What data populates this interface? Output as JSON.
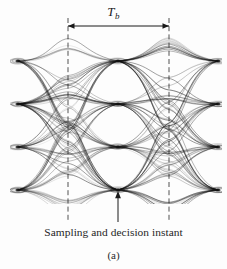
{
  "figure": {
    "kind": "eye-diagram",
    "width": 227,
    "height": 269,
    "background_color": "#fdfdfd",
    "trace_color": "#111111",
    "annotation_color": "#1a1a1a",
    "subfigure_label": "(a)",
    "symbol_period_label": "T",
    "symbol_period_subscript": "b",
    "sampling_caption": "Sampling and decision instant"
  },
  "chart_data": {
    "type": "line",
    "title": "",
    "subtitle": "",
    "xlabel": "",
    "ylabel": "",
    "legend": [],
    "grid": false,
    "annotations": [
      {
        "name": "symbol-period-arrow",
        "text": "T_b",
        "x_from": 68,
        "x_to": 169,
        "y": 26
      },
      {
        "name": "sampling-instant-arrow",
        "text": "Sampling and decision instant",
        "x": 118,
        "y_from": 222,
        "y_to": 191
      },
      {
        "name": "subfigure-label",
        "text": "(a)",
        "x": 115,
        "y": 256
      }
    ],
    "xlim": [
      18,
      218
    ],
    "ylim": [
      40,
      212
    ],
    "eye_openings": 3,
    "signal_levels": 4,
    "level_y": [
      61,
      104,
      147,
      190
    ],
    "crossing_x": [
      18,
      118,
      218
    ],
    "dashed_guide_x": [
      68,
      169
    ],
    "trace_count": 96
  }
}
